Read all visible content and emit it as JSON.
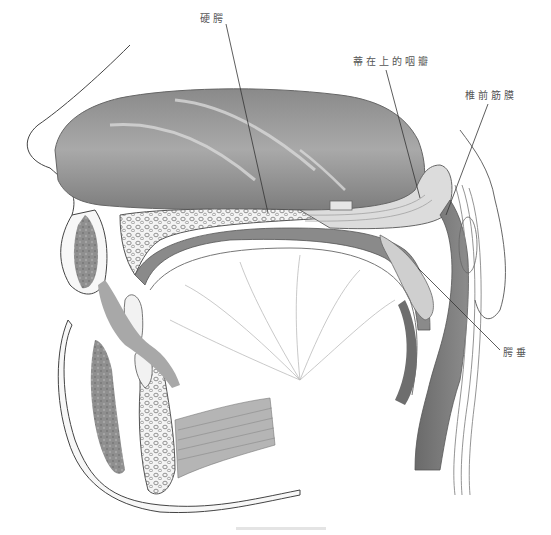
{
  "figure": {
    "type": "anatomical-illustration",
    "labels": [
      {
        "id": "hard_palate",
        "text": "硬腭"
      },
      {
        "id": "superiorly_based_pharyngeal_flap",
        "text": "蒂在上的咽瓣"
      },
      {
        "id": "prevertebral_fascia",
        "text": "椎前筋膜"
      },
      {
        "id": "uvula",
        "text": "腭垂"
      }
    ],
    "colors": {
      "background": "#ffffff",
      "leader_line": "#333333",
      "shading_dark": "#6e6e6e",
      "shading_mid": "#9a9a9a",
      "shading_light": "#c8c8c8",
      "label_text": "#555555"
    }
  }
}
